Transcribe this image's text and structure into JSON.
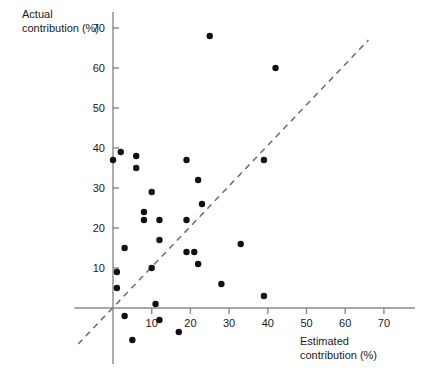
{
  "chart_data": {
    "type": "scatter",
    "title": "",
    "xlabel": "Estimated contribution (%)",
    "ylabel": "Actual contribution (%)",
    "xlim": [
      -10,
      78
    ],
    "ylim": [
      -13,
      75
    ],
    "xticks": [
      10,
      20,
      30,
      40,
      50,
      60,
      70
    ],
    "yticks": [
      10,
      20,
      30,
      40,
      50,
      60,
      70
    ],
    "grid": false,
    "legend": null,
    "reference_line": {
      "label": "y = x identity line",
      "style": "dashed",
      "x_start": -9,
      "y_start": -9,
      "x_end": 66,
      "y_end": 67
    },
    "points": [
      {
        "x": 0,
        "y": 37
      },
      {
        "x": 2,
        "y": 39
      },
      {
        "x": 6,
        "y": 38
      },
      {
        "x": 6,
        "y": 35
      },
      {
        "x": 19,
        "y": 37
      },
      {
        "x": 39,
        "y": 37
      },
      {
        "x": 25,
        "y": 68
      },
      {
        "x": 42,
        "y": 60
      },
      {
        "x": 10,
        "y": 29
      },
      {
        "x": 22,
        "y": 32
      },
      {
        "x": 8,
        "y": 24
      },
      {
        "x": 8,
        "y": 22
      },
      {
        "x": 12,
        "y": 22
      },
      {
        "x": 19,
        "y": 22
      },
      {
        "x": 23,
        "y": 26
      },
      {
        "x": 12,
        "y": 17
      },
      {
        "x": 3,
        "y": 15
      },
      {
        "x": 33,
        "y": 16
      },
      {
        "x": 19,
        "y": 14
      },
      {
        "x": 21,
        "y": 14
      },
      {
        "x": 1,
        "y": 9
      },
      {
        "x": 10,
        "y": 10
      },
      {
        "x": 22,
        "y": 11
      },
      {
        "x": 1,
        "y": 5
      },
      {
        "x": 28,
        "y": 6
      },
      {
        "x": 11,
        "y": 1
      },
      {
        "x": 39,
        "y": 3
      },
      {
        "x": 3,
        "y": -2
      },
      {
        "x": 12,
        "y": -3
      },
      {
        "x": 17,
        "y": -6
      },
      {
        "x": 5,
        "y": -8
      }
    ]
  }
}
